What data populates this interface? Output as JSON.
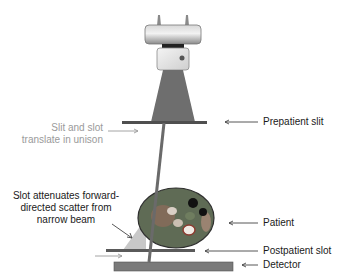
{
  "labels": {
    "prepatient_slit": "Prepatient slit",
    "slit_slot_line1": "Slit and slot",
    "slit_slot_line2": "translate in unison",
    "scatter_line1": "Slot attenuates forward-",
    "scatter_line2": "directed scatter from",
    "scatter_line3": "narrow beam",
    "patient": "Patient",
    "postpatient_slot": "Postpatient slot",
    "detector": "Detector"
  },
  "colors": {
    "tube_gray": "#9b9b9b",
    "beam": "#6e6e6e",
    "slit": "#5a5a5a",
    "scatter": "#c8c8c8",
    "detector": "#7a7a7a",
    "annotation_gray": "#9a9a9a",
    "text": "#1a1a1a"
  }
}
